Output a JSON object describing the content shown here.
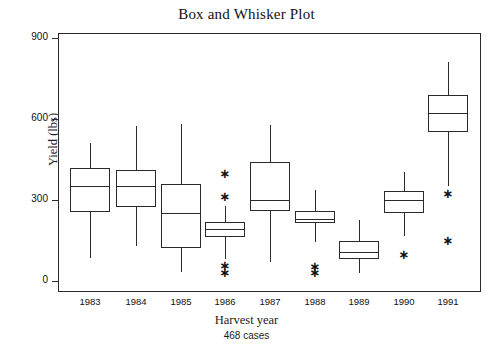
{
  "chart_data": {
    "type": "box",
    "title": "Box and Whisker Plot",
    "xlabel": "Harvest year",
    "ylabel": "Yield (lbs)",
    "subtitle": "468 cases",
    "ylim": [
      0,
      900
    ],
    "yticks": [
      0,
      300,
      600,
      900
    ],
    "ytick_labels": [
      "0",
      "300",
      "600",
      "900"
    ],
    "grid": false,
    "legend": "none",
    "categories": [
      "1983",
      "1984",
      "1985",
      "1986",
      "1987",
      "1988",
      "1989",
      "1990",
      "1991"
    ],
    "boxes": [
      {
        "category": "1983",
        "whisker_low": 85,
        "q1": 255,
        "median": 352,
        "q3": 418,
        "whisker_high": 511,
        "outliers": []
      },
      {
        "category": "1984",
        "whisker_low": 130,
        "q1": 274,
        "median": 352,
        "q3": 411,
        "whisker_high": 574,
        "outliers": []
      },
      {
        "category": "1985",
        "whisker_low": 33,
        "q1": 122,
        "median": 252,
        "q3": 359,
        "whisker_high": 581,
        "outliers": []
      },
      {
        "category": "1986",
        "whisker_low": 81,
        "q1": 163,
        "median": 193,
        "q3": 219,
        "whisker_high": 278,
        "outliers": [
          400,
          315,
          59,
          33
        ]
      },
      {
        "category": "1987",
        "whisker_low": 70,
        "q1": 259,
        "median": 300,
        "q3": 441,
        "whisker_high": 578,
        "outliers": []
      },
      {
        "category": "1988",
        "whisker_low": 144,
        "q1": 215,
        "median": 230,
        "q3": 259,
        "whisker_high": 337,
        "outliers": [
          56,
          33
        ]
      },
      {
        "category": "1989",
        "whisker_low": 30,
        "q1": 82,
        "median": 107,
        "q3": 148,
        "whisker_high": 226,
        "outliers": []
      },
      {
        "category": "1990",
        "whisker_low": 167,
        "q1": 252,
        "median": 300,
        "q3": 333,
        "whisker_high": 404,
        "outliers": [
          100
        ]
      },
      {
        "category": "1991",
        "whisker_low": 352,
        "q1": 552,
        "median": 622,
        "q3": 689,
        "whisker_high": 811,
        "outliers": [
          326,
          152
        ]
      }
    ]
  }
}
